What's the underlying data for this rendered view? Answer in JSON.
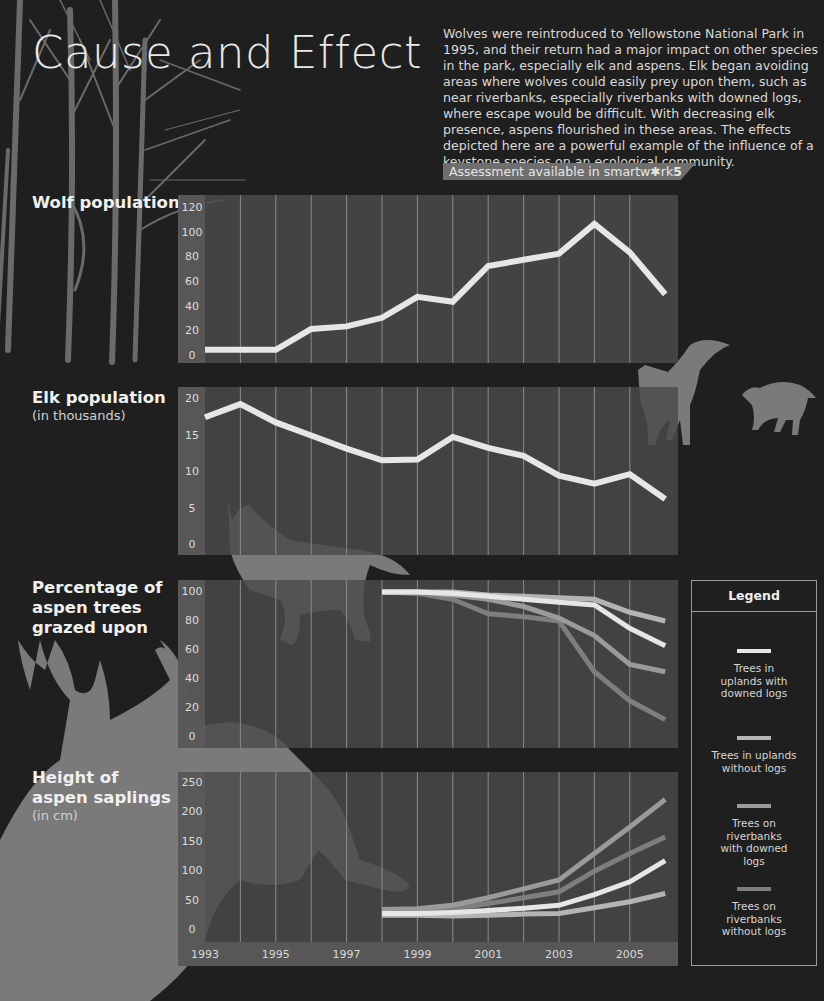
{
  "header": {
    "title": "Cause and Effect",
    "intro": "Wolves were reintroduced to Yellowstone National Park in 1995, and their return had a major impact on other species in the park, especially elk and aspens. Elk began avoiding areas where wolves could easily prey upon them, such as near riverbanks, especially riverbanks with downed logs, where escape would be difficult. With decreasing elk presence, aspens flourished in these areas. The effects depicted here are a powerful example of the influence of a keystone species on an ecological community.",
    "badge_text": "Assessment available in smartw✱rk",
    "badge_bold": "5"
  },
  "sections": {
    "wolf": {
      "title": "Wolf population",
      "subtitle": ""
    },
    "elk": {
      "title": "Elk population",
      "subtitle": "(in thousands)"
    },
    "grazed": {
      "title": "Percentage of aspen trees grazed upon",
      "subtitle": ""
    },
    "height": {
      "title": "Height of aspen saplings",
      "subtitle": "(in cm)"
    }
  },
  "legend": {
    "title": "Legend",
    "items": [
      {
        "label": "Trees in uplands with downed logs",
        "color": "#e6e6e6"
      },
      {
        "label": "Trees in uplands without logs",
        "color": "#b4b4b4"
      },
      {
        "label": "Trees on riverbanks with downed logs",
        "color": "#9a9a9a"
      },
      {
        "label": "Trees on riverbanks without logs",
        "color": "#7e7e7e"
      }
    ]
  },
  "colors": {
    "background": "#1f1f1f",
    "panel": "#4a4a4a",
    "axis_column": "#5a5a5a",
    "primary_line": "#e6e6e6",
    "silhouette": "#7a7a7a"
  },
  "chart_data": [
    {
      "type": "line",
      "title": "Wolf population",
      "xlabel": "",
      "ylabel": "",
      "x": [
        1993,
        1994,
        1995,
        1996,
        1997,
        1998,
        1999,
        2000,
        2001,
        2002,
        2003,
        2004,
        2005,
        2006
      ],
      "series": [
        {
          "name": "Wolves",
          "values": [
            5,
            5,
            5,
            22,
            24,
            31,
            48,
            44,
            73,
            78,
            83,
            107,
            84,
            50
          ]
        }
      ],
      "yticks": [
        0,
        20,
        40,
        60,
        80,
        100,
        120
      ],
      "ylim": [
        0,
        120
      ],
      "grid": "vertical"
    },
    {
      "type": "line",
      "title": "Elk population (in thousands)",
      "xlabel": "",
      "ylabel": "",
      "x": [
        1993,
        1994,
        1995,
        1996,
        1997,
        1998,
        1999,
        2000,
        2001,
        2002,
        2003,
        2004,
        2005,
        2006
      ],
      "series": [
        {
          "name": "Elk",
          "values": [
            17.5,
            19.3,
            16.8,
            15.0,
            13.2,
            11.6,
            11.7,
            14.8,
            13.3,
            12.2,
            9.5,
            8.4,
            9.7,
            6.3
          ]
        }
      ],
      "yticks": [
        0,
        5,
        10,
        15,
        20
      ],
      "ylim": [
        0,
        20
      ],
      "grid": "vertical"
    },
    {
      "type": "line",
      "title": "Percentage of aspen trees grazed upon",
      "xlabel": "",
      "ylabel": "",
      "x": [
        1998,
        1999,
        2000,
        2001,
        2002,
        2003,
        2004,
        2005,
        2006
      ],
      "series": [
        {
          "name": "Trees in uplands with downed logs",
          "values": [
            100,
            100,
            99,
            97,
            95,
            93,
            91,
            75,
            63
          ]
        },
        {
          "name": "Trees in uplands without logs",
          "values": [
            100,
            100,
            100,
            98,
            97,
            96,
            95,
            86,
            80
          ]
        },
        {
          "name": "Trees on riverbanks with downed logs",
          "values": [
            100,
            100,
            98,
            95,
            90,
            82,
            70,
            50,
            45
          ]
        },
        {
          "name": "Trees on riverbanks without logs",
          "values": [
            100,
            99,
            95,
            85,
            83,
            80,
            45,
            25,
            12
          ]
        }
      ],
      "yticks": [
        0,
        20,
        40,
        60,
        80,
        100
      ],
      "ylim": [
        0,
        100
      ],
      "grid": "vertical"
    },
    {
      "type": "line",
      "title": "Height of aspen saplings (in cm)",
      "xlabel": "",
      "ylabel": "",
      "x": [
        1998,
        1999,
        2000,
        2001,
        2002,
        2003,
        2004,
        2005,
        2006
      ],
      "series": [
        {
          "name": "Trees in uplands with downed logs",
          "values": [
            28,
            28,
            30,
            33,
            37,
            42,
            60,
            82,
            118
          ]
        },
        {
          "name": "Trees in uplands without logs",
          "values": [
            25,
            25,
            24,
            25,
            27,
            28,
            38,
            48,
            62
          ]
        },
        {
          "name": "Trees on riverbanks with downed logs",
          "values": [
            35,
            36,
            42,
            55,
            70,
            85,
            130,
            175,
            222
          ]
        },
        {
          "name": "Trees on riverbanks without logs",
          "values": [
            33,
            33,
            36,
            45,
            55,
            65,
            100,
            130,
            158
          ]
        }
      ],
      "yticks": [
        0,
        50,
        100,
        150,
        200,
        250
      ],
      "ylim": [
        0,
        250
      ],
      "xticks": [
        1993,
        1995,
        1997,
        1999,
        2001,
        2003,
        2005
      ],
      "grid": "vertical"
    }
  ]
}
